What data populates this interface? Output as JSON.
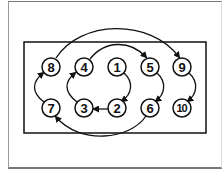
{
  "diagram": {
    "type": "bolt-tightening-sequence",
    "colors": {
      "line": "#111111",
      "background": "#ffffff",
      "frame": "#777777"
    },
    "bolts": [
      {
        "label": "8",
        "row": "top",
        "col": 0,
        "cx": 51,
        "cy": 67
      },
      {
        "label": "4",
        "row": "top",
        "col": 1,
        "cx": 84,
        "cy": 67
      },
      {
        "label": "1",
        "row": "top",
        "col": 2,
        "cx": 117,
        "cy": 67
      },
      {
        "label": "5",
        "row": "top",
        "col": 3,
        "cx": 150,
        "cy": 67
      },
      {
        "label": "9",
        "row": "top",
        "col": 4,
        "cx": 182,
        "cy": 67
      },
      {
        "label": "7",
        "row": "bottom",
        "col": 0,
        "cx": 51,
        "cy": 108
      },
      {
        "label": "3",
        "row": "bottom",
        "col": 1,
        "cx": 84,
        "cy": 108
      },
      {
        "label": "2",
        "row": "bottom",
        "col": 2,
        "cx": 117,
        "cy": 108
      },
      {
        "label": "6",
        "row": "bottom",
        "col": 3,
        "cx": 150,
        "cy": 108
      },
      {
        "label": "10",
        "row": "bottom",
        "col": 4,
        "cx": 182,
        "cy": 108
      }
    ],
    "sequence": [
      "1",
      "2",
      "3",
      "4",
      "5",
      "6",
      "7",
      "8",
      "9",
      "10"
    ]
  }
}
